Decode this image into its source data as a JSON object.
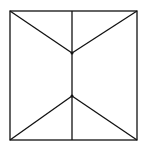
{
  "diagram": {
    "width": 145,
    "height": 154,
    "background": "#ffffff",
    "stroke_color": "#111111",
    "stroke_width": 1.3,
    "square": {
      "x1": 10,
      "y1": 11,
      "x2": 137,
      "y2": 140
    },
    "center_line": {
      "x": 72,
      "y1": 11,
      "y2": 140
    },
    "upper_junction": {
      "x": 72,
      "y": 53
    },
    "lower_junction": {
      "x": 72,
      "y": 96
    },
    "lines": [
      {
        "name": "diagonal-top-left",
        "x1": 10,
        "y1": 11,
        "x2": 72,
        "y2": 53
      },
      {
        "name": "diagonal-top-right",
        "x1": 137,
        "y1": 11,
        "x2": 72,
        "y2": 53
      },
      {
        "name": "diagonal-bottom-left",
        "x1": 10,
        "y1": 140,
        "x2": 72,
        "y2": 96
      },
      {
        "name": "diagonal-bottom-right",
        "x1": 137,
        "y1": 140,
        "x2": 72,
        "y2": 96
      }
    ]
  }
}
